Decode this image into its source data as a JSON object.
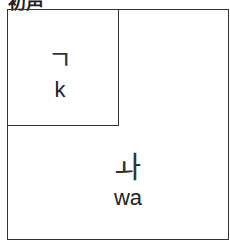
{
  "title": "初声",
  "blocks": [
    {
      "jamo": "ㄱ",
      "romanization": "k",
      "position": "top-left"
    },
    {
      "jamo": "ㅘ",
      "romanization": "wa",
      "position": "bottom"
    }
  ]
}
